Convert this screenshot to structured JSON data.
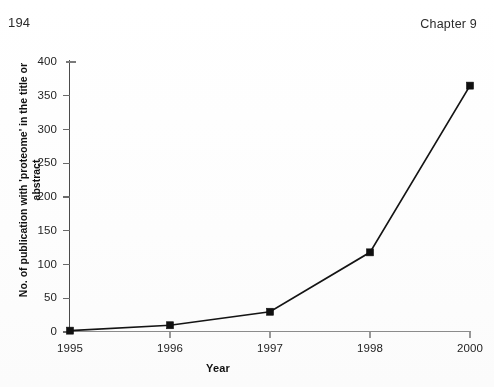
{
  "page": {
    "page_number": "194",
    "chapter_label": "Chapter 9"
  },
  "chart_data": {
    "type": "line",
    "title": "",
    "xlabel": "Year",
    "ylabel": "No. of publication with 'proteome' in the title or abstract",
    "ylabel_line1": "No. of publication with 'proteome' in the title or",
    "ylabel_line2": "abstract",
    "categories": [
      "1995",
      "1996",
      "1997",
      "1998",
      "2000"
    ],
    "x": [
      1995,
      1996,
      1997,
      1998,
      2000
    ],
    "values": [
      2,
      10,
      30,
      118,
      365
    ],
    "series": [
      {
        "name": "Publications mentioning 'proteome'",
        "values": [
          2,
          10,
          30,
          118,
          365
        ],
        "color": "#101010",
        "marker": "filled-square"
      }
    ],
    "ylim": [
      0,
      400
    ],
    "yticks": [
      0,
      50,
      100,
      150,
      200,
      250,
      300,
      350,
      400
    ],
    "ytick_labels": [
      "0",
      "50",
      "100",
      "150",
      "200",
      "250",
      "300",
      "350",
      "400"
    ],
    "xtick_labels": [
      "1995",
      "1996",
      "1997",
      "1998",
      "2000"
    ],
    "grid": false,
    "legend": false,
    "legend_position": "none"
  },
  "colors": {
    "line": "#101010",
    "marker": "#101010",
    "axis": "#4b4b4b",
    "text": "#1b1b1b",
    "background": "#ffffff"
  }
}
